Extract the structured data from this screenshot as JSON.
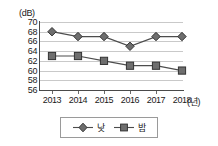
{
  "chart_data": {
    "type": "line",
    "title": "",
    "xlabel": "(년)",
    "ylabel": "(dB)",
    "categories": [
      "2013",
      "2014",
      "2015",
      "2016",
      "2017",
      "2018"
    ],
    "x": [
      2013,
      2014,
      2015,
      2016,
      2017,
      2018
    ],
    "ylim": [
      56,
      70
    ],
    "y_ticks": [
      70,
      68,
      66,
      64,
      62,
      60,
      58,
      56
    ],
    "grid": true,
    "legend_position": "bottom-center",
    "series": [
      {
        "name": "낮",
        "marker": "diamond",
        "color": "#4d4d4d",
        "values": [
          68,
          67,
          67,
          65,
          67,
          67
        ]
      },
      {
        "name": "밤",
        "marker": "square",
        "color": "#4d4d4d",
        "values": [
          63,
          63,
          62,
          61,
          61,
          60
        ]
      }
    ]
  },
  "axes": {
    "y_unit_label": "(dB)",
    "x_unit_label": "(년)",
    "y_tick_labels": [
      "70",
      "68",
      "66",
      "64",
      "62",
      "60",
      "58",
      "56"
    ],
    "x_tick_labels": [
      "2013",
      "2014",
      "2015",
      "2016",
      "2017",
      "2018"
    ]
  },
  "legend": {
    "entries": [
      {
        "label": "낮",
        "marker": "diamond-marker-icon"
      },
      {
        "label": "밤",
        "marker": "square-marker-icon"
      }
    ]
  },
  "colors": {
    "series_line": "#4d4d4d",
    "marker_fill": "#6e6e6e",
    "marker_stroke": "#333333",
    "gridline": "#c9c9c9",
    "axis": "#4a4a4a",
    "background": "#ffffff",
    "legend_border": "#9a9a9a"
  }
}
